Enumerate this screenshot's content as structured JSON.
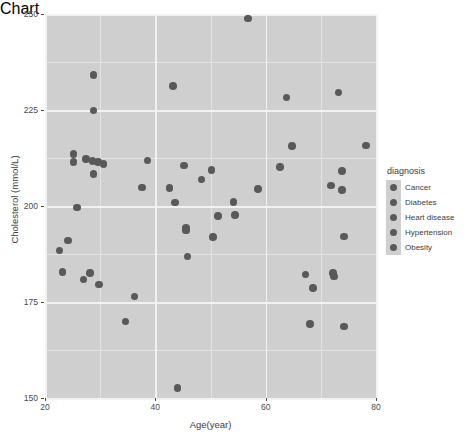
{
  "chart_data": {
    "type": "scatter",
    "title": "",
    "xlabel": "Age(year)",
    "ylabel": "Cholesterol (mmol/L)",
    "xlim": [
      20,
      80
    ],
    "ylim": [
      150,
      250
    ],
    "xticks": [
      20,
      40,
      60,
      80
    ],
    "yticks": [
      150,
      175,
      200,
      225,
      250
    ],
    "grid": true,
    "legend_position": "right",
    "legend_title": "diagnosis",
    "legend_entries": [
      "Cancer",
      "Diabetes",
      "Heart disease",
      "Hypertension",
      "Obesity"
    ],
    "point_color": "#595959",
    "panel_color": "#cfcfcf",
    "gridline_color": "#f2f2f2",
    "points": [
      {
        "x": 56.8,
        "y": 248.8
      },
      {
        "x": 28.8,
        "y": 234.1
      },
      {
        "x": 43.2,
        "y": 231.2
      },
      {
        "x": 73.2,
        "y": 229.6
      },
      {
        "x": 28.8,
        "y": 224.9
      },
      {
        "x": 63.8,
        "y": 228.3
      },
      {
        "x": 25.2,
        "y": 213.5
      },
      {
        "x": 25.2,
        "y": 211.4
      },
      {
        "x": 27.4,
        "y": 212.2
      },
      {
        "x": 28.6,
        "y": 211.7
      },
      {
        "x": 29.6,
        "y": 211.4
      },
      {
        "x": 30.6,
        "y": 211.0
      },
      {
        "x": 64.8,
        "y": 215.6
      },
      {
        "x": 78.2,
        "y": 215.8
      },
      {
        "x": 38.6,
        "y": 211.9
      },
      {
        "x": 28.8,
        "y": 208.4
      },
      {
        "x": 62.6,
        "y": 210.1
      },
      {
        "x": 73.8,
        "y": 209.1
      },
      {
        "x": 45.2,
        "y": 210.5
      },
      {
        "x": 50.2,
        "y": 209.4
      },
      {
        "x": 48.4,
        "y": 206.9
      },
      {
        "x": 71.8,
        "y": 205.3
      },
      {
        "x": 42.6,
        "y": 204.7
      },
      {
        "x": 37.6,
        "y": 204.8
      },
      {
        "x": 58.6,
        "y": 204.5
      },
      {
        "x": 73.8,
        "y": 204.1
      },
      {
        "x": 25.8,
        "y": 199.6
      },
      {
        "x": 54.2,
        "y": 201.0
      },
      {
        "x": 43.6,
        "y": 200.9
      },
      {
        "x": 51.4,
        "y": 197.4
      },
      {
        "x": 54.4,
        "y": 197.6
      },
      {
        "x": 45.6,
        "y": 194.3
      },
      {
        "x": 45.6,
        "y": 193.6
      },
      {
        "x": 50.4,
        "y": 192.0
      },
      {
        "x": 24.2,
        "y": 191.0
      },
      {
        "x": 74.2,
        "y": 192.1
      },
      {
        "x": 22.6,
        "y": 188.4
      },
      {
        "x": 45.8,
        "y": 186.9
      },
      {
        "x": 23.2,
        "y": 182.8
      },
      {
        "x": 28.2,
        "y": 182.6
      },
      {
        "x": 27.0,
        "y": 180.9
      },
      {
        "x": 67.2,
        "y": 182.2
      },
      {
        "x": 72.2,
        "y": 182.6
      },
      {
        "x": 72.4,
        "y": 181.6
      },
      {
        "x": 29.8,
        "y": 179.6
      },
      {
        "x": 68.6,
        "y": 178.6
      },
      {
        "x": 36.2,
        "y": 176.4
      },
      {
        "x": 34.6,
        "y": 169.9
      },
      {
        "x": 68.0,
        "y": 169.2
      },
      {
        "x": 74.2,
        "y": 168.6
      },
      {
        "x": 44.0,
        "y": 152.6
      }
    ]
  }
}
